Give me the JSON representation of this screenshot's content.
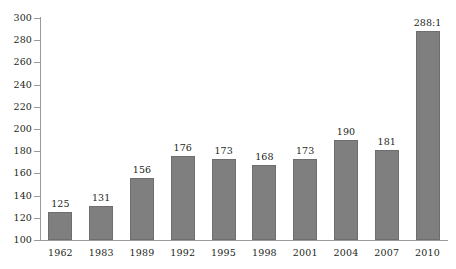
{
  "chart_data": {
    "type": "bar",
    "title": "",
    "subtitle": "",
    "xlabel": "",
    "ylabel": "",
    "categories": [
      "1962",
      "1983",
      "1989",
      "1992",
      "1995",
      "1998",
      "2001",
      "2004",
      "2007",
      "2010"
    ],
    "values": [
      125,
      131,
      156,
      176,
      173,
      168,
      173,
      190,
      181,
      288
    ],
    "data_labels": [
      "125",
      "131",
      "156",
      "176",
      "173",
      "168",
      "173",
      "190",
      "181",
      "288:1"
    ],
    "ylim": [
      100,
      300
    ],
    "ytick_step": 20,
    "ytick_labels": [
      "300",
      "280",
      "260",
      "240",
      "220",
      "200",
      "180",
      "160",
      "140",
      "120",
      "100"
    ],
    "ytick_values": [
      300,
      280,
      260,
      240,
      220,
      200,
      180,
      160,
      140,
      120,
      100
    ],
    "grid": false,
    "legend": false,
    "legend_position": "none",
    "series": [
      {
        "name": "ratio",
        "values": [
          125,
          131,
          156,
          176,
          173,
          168,
          173,
          190,
          181,
          288
        ]
      }
    ],
    "colors": {
      "bar_fill": "#7f7f7f",
      "bar_edge": "#6e6e6e",
      "axis": "#9a9a9a",
      "text": "#231f20",
      "background": "#ffffff"
    }
  }
}
